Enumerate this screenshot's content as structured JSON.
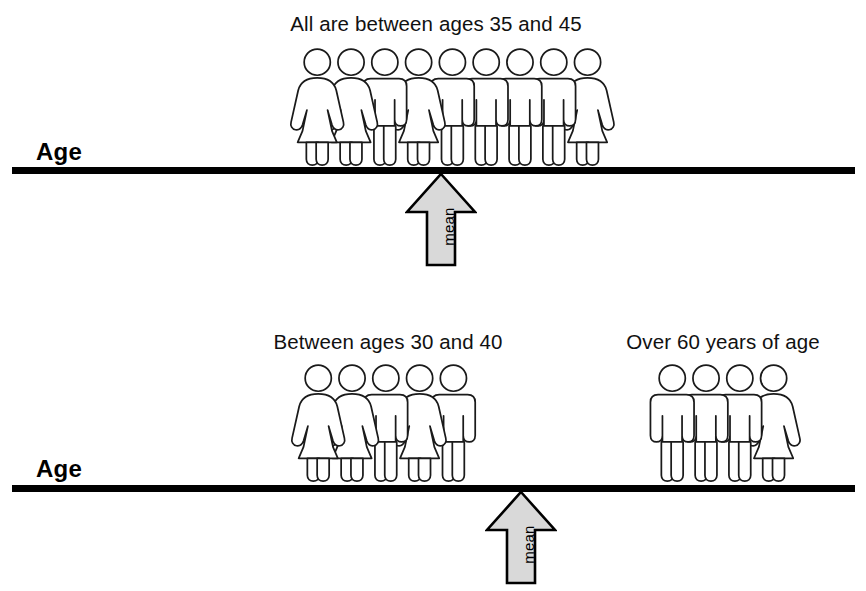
{
  "figure": {
    "type": "statistical-illustration",
    "background_color": "#ffffff",
    "line_color": "#000000",
    "arrow_fill_color": "#d9d9d9",
    "arrow_stroke_color": "#000000",
    "person_fill_color": "#ffffff",
    "person_stroke_color": "#1a1a1a"
  },
  "panels": [
    {
      "id": "top",
      "axis_label": "Age",
      "mean": {
        "label": "mean"
      },
      "groups": [
        {
          "id": "top-all",
          "caption": "All are between ages 35 and 45",
          "count": 9,
          "people": [
            "female",
            "female",
            "male",
            "female",
            "male",
            "male",
            "male",
            "male",
            "female"
          ]
        }
      ]
    },
    {
      "id": "bottom",
      "axis_label": "Age",
      "mean": {
        "label": "mean"
      },
      "groups": [
        {
          "id": "bottom-left",
          "caption": "Between ages 30 and 40",
          "count": 5,
          "people": [
            "female",
            "female",
            "male",
            "female",
            "male"
          ]
        },
        {
          "id": "bottom-right",
          "caption": "Over 60 years of age",
          "count": 4,
          "people": [
            "male",
            "male",
            "male",
            "female"
          ]
        }
      ]
    }
  ],
  "chart_data": {
    "type": "diagram",
    "xlabel": "Age",
    "panels": [
      {
        "name": "Low variability",
        "axis_label": "Age",
        "mean_marker": "mean",
        "clusters": [
          {
            "label": "All are between ages 35 and 45",
            "n": 9,
            "age_range": [
              35,
              45
            ]
          }
        ]
      },
      {
        "name": "High variability",
        "axis_label": "Age",
        "mean_marker": "mean",
        "clusters": [
          {
            "label": "Between ages 30 and 40",
            "n": 5,
            "age_range": [
              30,
              40
            ]
          },
          {
            "label": "Over 60 years of age",
            "n": 4,
            "age_range": [
              60,
              null
            ]
          }
        ]
      }
    ]
  }
}
